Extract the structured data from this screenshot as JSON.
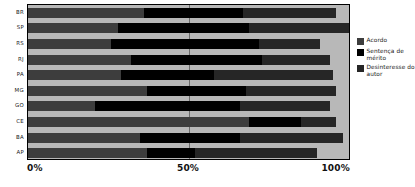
{
  "chart_data": {
    "type": "bar",
    "orientation": "horizontal",
    "stacked": true,
    "title": "",
    "subtitle": "",
    "xlabel": "",
    "ylabel": "",
    "xlim": [
      0,
      100
    ],
    "xticks": [
      "0%",
      "50%",
      "100%"
    ],
    "xtick_values": [
      0,
      50,
      100
    ],
    "grid": true,
    "gridlines_at": [
      50
    ],
    "legend_position": "right",
    "categories": [
      "BR",
      "SP",
      "RS",
      "RJ",
      "PA",
      "MG",
      "GO",
      "CE",
      "BA",
      "AP"
    ],
    "series": [
      {
        "name": "Acordo",
        "color": "#3d3d3d",
        "values": [
          36,
          28,
          26,
          32,
          29,
          37,
          21,
          69,
          35,
          37
        ]
      },
      {
        "name": "Sentença de mérito",
        "color": "#000000",
        "values": [
          31,
          41,
          46,
          41,
          29,
          31,
          45,
          16,
          31,
          15
        ]
      },
      {
        "name": "Desinteresse do autor",
        "color": "#262626",
        "values": [
          29,
          31,
          19,
          21,
          37,
          28,
          28,
          11,
          32,
          38
        ]
      }
    ],
    "cumulative_ends": {
      "BR": [
        36,
        67,
        96
      ],
      "SP": [
        28,
        69,
        100
      ],
      "RS": [
        26,
        72,
        91
      ],
      "RJ": [
        32,
        73,
        94
      ],
      "PA": [
        29,
        58,
        95
      ],
      "MG": [
        37,
        68,
        96
      ],
      "GO": [
        21,
        66,
        94
      ],
      "CE": [
        69,
        85,
        96
      ],
      "BA": [
        35,
        66,
        98
      ],
      "AP": [
        37,
        52,
        90
      ]
    },
    "remainder_color": "#b8b8b8"
  },
  "legend": {
    "items": [
      {
        "label": "Acordo",
        "color": "#3d3d3d"
      },
      {
        "label": "Sentença de mérito",
        "color": "#000000"
      },
      {
        "label": "Desinteresse do autor",
        "color": "#262626"
      }
    ]
  },
  "axis": {
    "x_ticks": [
      "0%",
      "50%",
      "100%"
    ]
  }
}
